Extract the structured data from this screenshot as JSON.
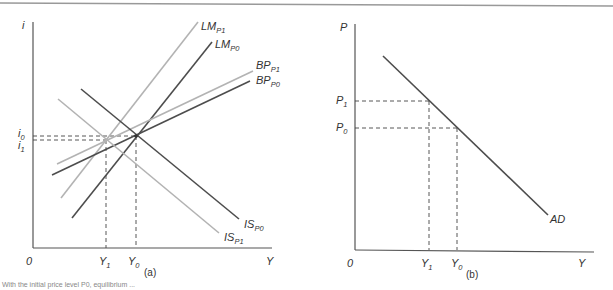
{
  "figure": {
    "top_rule_color": "#999999",
    "caption_partial": "With the initial price level P0, equilibrium ...",
    "panels": [
      {
        "id": "a",
        "label": "(a)",
        "y_axis_label": "i",
        "x_axis_label": "Y",
        "origin_label": "0",
        "y_ticks": [
          {
            "main": "i",
            "sub": "0"
          },
          {
            "main": "i",
            "sub": "1"
          }
        ],
        "x_ticks": [
          {
            "main": "Y",
            "sub": "1"
          },
          {
            "main": "Y",
            "sub": "0"
          }
        ],
        "curves": [
          {
            "name": "LM",
            "sub": "P1",
            "color": "#b3b3b3"
          },
          {
            "name": "LM",
            "sub": "P0",
            "color": "#4d4d4d"
          },
          {
            "name": "BP",
            "sub": "P1",
            "color": "#b3b3b3"
          },
          {
            "name": "BP",
            "sub": "P0",
            "color": "#4d4d4d"
          },
          {
            "name": "IS",
            "sub": "P0",
            "color": "#4d4d4d"
          },
          {
            "name": "IS",
            "sub": "P1",
            "color": "#b3b3b3"
          }
        ]
      },
      {
        "id": "b",
        "label": "(b)",
        "y_axis_label": "P",
        "x_axis_label": "Y",
        "origin_label": "0",
        "y_ticks": [
          {
            "main": "P",
            "sub": "1"
          },
          {
            "main": "P",
            "sub": "0"
          }
        ],
        "x_ticks": [
          {
            "main": "Y",
            "sub": "1"
          },
          {
            "main": "Y",
            "sub": "0"
          }
        ],
        "curves": [
          {
            "name": "AD",
            "sub": "",
            "color": "#4d4d4d"
          }
        ]
      }
    ]
  }
}
